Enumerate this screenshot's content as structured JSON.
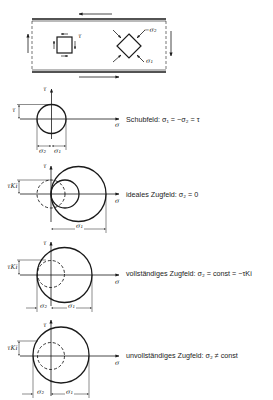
{
  "figure": {
    "plate": {
      "label_tau": "τ",
      "label_minus_sigma2": "−σ₂",
      "label_sigma1": "σ₁"
    },
    "diagrams": [
      {
        "id": "schubfeld",
        "axis_tau": "τ",
        "axis_sigma": "σ",
        "dim_left": "τ",
        "dim_sigma2": "σ₂",
        "dim_sigma1": "σ₁",
        "caption": "Schubfeld:  σ₁ = −σ₂ = τ"
      },
      {
        "id": "ideales-zugfeld",
        "axis_tau": "τ",
        "axis_sigma": "σ",
        "dim_left": "τKi",
        "dim_sigma1": "σ₁",
        "caption": "ideales Zugfeld:  σ₂ = 0"
      },
      {
        "id": "vollstaendiges-zugfeld",
        "axis_tau": "τ",
        "axis_sigma": "σ",
        "dim_left": "τKi",
        "dim_sigma2": "σ₂",
        "dim_sigma1": "σ₁",
        "caption": "vollständiges Zugfeld:  σ₂ = const = −τKi"
      },
      {
        "id": "unvollstaendiges-zugfeld",
        "axis_tau": "τ",
        "axis_sigma": "σ",
        "dim_left": "τKi",
        "dim_sigma2": "σ₂",
        "dim_sigma1": "σ₁",
        "caption": "unvollständiges Zugfeld:  σ₂ ≠ const"
      }
    ]
  }
}
